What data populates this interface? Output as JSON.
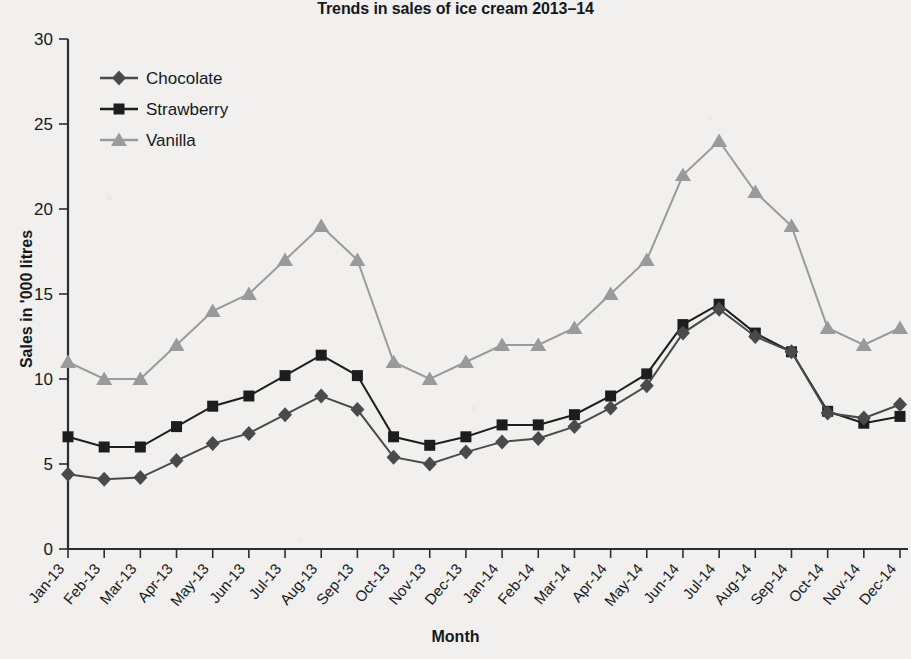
{
  "chart_data": {
    "type": "line",
    "title": "Trends in sales of ice cream 2013–14",
    "xlabel": "Month",
    "ylabel": "Sales in '000 litres",
    "ylim": [
      0,
      30
    ],
    "ytick_step": 5,
    "yticks": [
      "0",
      "5",
      "10",
      "15",
      "20",
      "25",
      "30"
    ],
    "grid": false,
    "legend_position": "top-left",
    "categories": [
      "Jan-13",
      "Feb-13",
      "Mar-13",
      "Apr-13",
      "May-13",
      "Jun-13",
      "Jul-13",
      "Aug-13",
      "Sep-13",
      "Oct-13",
      "Nov-13",
      "Dec-13",
      "Jan-14",
      "Feb-14",
      "Mar-14",
      "Apr-14",
      "May-14",
      "Jun-14",
      "Jul-14",
      "Aug-14",
      "Sep-14",
      "Oct-14",
      "Nov-14",
      "Dec-14"
    ],
    "series": [
      {
        "name": "Chocolate",
        "color": "#4a4a4a",
        "marker": "diamond",
        "values": [
          4.4,
          4.1,
          4.2,
          5.2,
          6.2,
          6.8,
          7.9,
          9.0,
          8.2,
          5.4,
          5.0,
          5.7,
          6.3,
          6.5,
          7.2,
          8.3,
          9.6,
          12.7,
          14.1,
          12.5,
          11.6,
          8.0,
          7.7,
          8.5
        ]
      },
      {
        "name": "Strawberry",
        "color": "#1d1d1d",
        "marker": "square",
        "values": [
          6.6,
          6.0,
          6.0,
          7.2,
          8.4,
          9.0,
          10.2,
          11.4,
          10.2,
          6.6,
          6.1,
          6.6,
          7.3,
          7.3,
          7.9,
          9.0,
          10.3,
          13.2,
          14.4,
          12.7,
          11.6,
          8.1,
          7.4,
          7.8
        ]
      },
      {
        "name": "Vanilla",
        "color": "#9a9a9a",
        "marker": "triangle",
        "values": [
          11,
          10,
          10,
          12,
          14,
          15,
          17,
          19,
          17,
          11,
          10,
          11,
          12,
          12,
          13,
          15,
          17,
          22,
          24,
          21,
          19,
          13,
          12,
          13
        ]
      }
    ]
  },
  "legend": {
    "items": [
      {
        "label": "Chocolate"
      },
      {
        "label": "Strawberry"
      },
      {
        "label": "Vanilla"
      }
    ]
  }
}
